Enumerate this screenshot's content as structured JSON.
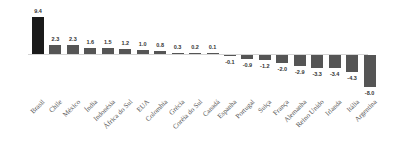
{
  "chart_data": {
    "type": "bar",
    "title": "",
    "xlabel": "",
    "ylabel": "",
    "grid": false,
    "legend": null,
    "categories": [
      "Brasil",
      "Chile",
      "México",
      "Índia",
      "Indonésia",
      "África do Sul",
      "EUA",
      "Colombia",
      "Grécia",
      "Coréia do Sul",
      "Canadá",
      "Espanha",
      "Portugal",
      "Suiça",
      "França",
      "Alemanha",
      "Reino Unido",
      "Irlanda",
      "Itália",
      "Argentina"
    ],
    "values": [
      9.4,
      2.3,
      2.3,
      1.6,
      1.5,
      1.2,
      1.0,
      0.8,
      0.3,
      0.2,
      0.1,
      -0.1,
      -0.9,
      -1.2,
      -2.0,
      -2.9,
      -3.3,
      -3.4,
      -4.3,
      -8.0
    ],
    "value_labels": [
      "9.4",
      "2.3",
      "2.3",
      "1.6",
      "1.5",
      "1.2",
      "1.0",
      "0.8",
      "0.3",
      "0.2",
      "0.1",
      "-0.1",
      "-0.9",
      "-1.2",
      "-2.0",
      "-2.9",
      "-3.3",
      "-3.4",
      "-4.3",
      "-8.0"
    ],
    "highlight_index": 0,
    "colors": {
      "highlight": "#1a1a1a",
      "default": "#555555",
      "axis": "#d4d4d4"
    },
    "ylim": [
      -8.0,
      9.4
    ]
  }
}
